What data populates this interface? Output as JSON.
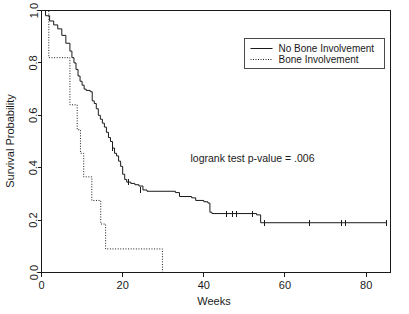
{
  "chart_data": {
    "type": "line",
    "subtype": "kaplan-meier-survival-step",
    "title": "",
    "xlabel": "Weeks",
    "ylabel": "Survival Probability",
    "xlim": [
      0,
      86
    ],
    "ylim": [
      0,
      1.0
    ],
    "xticks": [
      0,
      20,
      40,
      60,
      80
    ],
    "xticklabels": [
      "0",
      "20",
      "40",
      "60",
      "80"
    ],
    "yticks": [
      0.0,
      0.2,
      0.4,
      0.6,
      0.8,
      1.0
    ],
    "yticklabels": [
      "0.0",
      "0.2",
      "0.4",
      "0.6",
      "0.8",
      "1.0"
    ],
    "grid": false,
    "legend_position": "top-right",
    "annotations": [
      {
        "text": "logrank test p-value = .006",
        "x": 52,
        "y": 0.42
      }
    ],
    "series": [
      {
        "name": "No Bone Involvement",
        "linestyle": "solid",
        "color": "#1a1a1a",
        "points": [
          [
            0,
            1.0
          ],
          [
            1,
            0.98
          ],
          [
            2,
            0.96
          ],
          [
            3,
            0.945
          ],
          [
            4,
            0.93
          ],
          [
            5,
            0.905
          ],
          [
            6,
            0.875
          ],
          [
            7,
            0.845
          ],
          [
            7.5,
            0.82
          ],
          [
            8,
            0.8
          ],
          [
            8.5,
            0.775
          ],
          [
            9,
            0.75
          ],
          [
            9.5,
            0.73
          ],
          [
            10,
            0.715
          ],
          [
            10.5,
            0.7
          ],
          [
            11,
            0.695
          ],
          [
            12,
            0.69
          ],
          [
            12.5,
            0.655
          ],
          [
            13,
            0.645
          ],
          [
            13.5,
            0.625
          ],
          [
            14,
            0.6
          ],
          [
            14.5,
            0.585
          ],
          [
            15,
            0.57
          ],
          [
            15.5,
            0.555
          ],
          [
            16,
            0.535
          ],
          [
            16.5,
            0.515
          ],
          [
            17,
            0.5
          ],
          [
            17.5,
            0.475
          ],
          [
            18,
            0.455
          ],
          [
            18.5,
            0.445
          ],
          [
            19,
            0.425
          ],
          [
            19.5,
            0.405
          ],
          [
            20,
            0.375
          ],
          [
            20.5,
            0.355
          ],
          [
            21,
            0.345
          ],
          [
            22,
            0.34
          ],
          [
            23,
            0.335
          ],
          [
            24,
            0.33
          ],
          [
            25,
            0.315
          ],
          [
            26,
            0.31
          ],
          [
            33,
            0.305
          ],
          [
            34,
            0.29
          ],
          [
            37,
            0.285
          ],
          [
            38,
            0.275
          ],
          [
            40,
            0.27
          ],
          [
            41,
            0.265
          ],
          [
            41.5,
            0.23
          ],
          [
            42,
            0.225
          ],
          [
            53,
            0.22
          ],
          [
            54,
            0.19
          ],
          [
            85,
            0.19
          ]
        ],
        "censored": [
          [
            17.5,
            0.475
          ],
          [
            21.5,
            0.345
          ],
          [
            24.5,
            0.315
          ],
          [
            45.5,
            0.225
          ],
          [
            47,
            0.225
          ],
          [
            48,
            0.225
          ],
          [
            52,
            0.225
          ],
          [
            55,
            0.19
          ],
          [
            66,
            0.19
          ],
          [
            74,
            0.19
          ],
          [
            75,
            0.19
          ],
          [
            85,
            0.19
          ]
        ]
      },
      {
        "name": "Bone Involvement",
        "linestyle": "dotted",
        "color": "#1a1a1a",
        "points": [
          [
            0,
            1.0
          ],
          [
            1.8,
            1.0
          ],
          [
            1.8,
            0.82
          ],
          [
            7.0,
            0.82
          ],
          [
            7.0,
            0.64
          ],
          [
            8.8,
            0.64
          ],
          [
            8.8,
            0.545
          ],
          [
            9.6,
            0.545
          ],
          [
            9.6,
            0.455
          ],
          [
            10.4,
            0.455
          ],
          [
            10.4,
            0.365
          ],
          [
            12.4,
            0.365
          ],
          [
            12.4,
            0.275
          ],
          [
            14.6,
            0.275
          ],
          [
            14.6,
            0.185
          ],
          [
            15.8,
            0.185
          ],
          [
            15.8,
            0.09
          ],
          [
            29.8,
            0.09
          ],
          [
            29.8,
            0.0
          ]
        ],
        "censored": []
      }
    ]
  },
  "legend": {
    "entries": [
      {
        "label": "No Bone Involvement",
        "linestyle": "solid"
      },
      {
        "label": "Bone Involvement",
        "linestyle": "dotted"
      }
    ]
  },
  "axes": {
    "x_title": "Weeks",
    "y_title": "Survival Probability"
  },
  "colors": {
    "ink": "#1a1a1a",
    "legend_border": "#4a4a4a",
    "background": "#ffffff"
  }
}
